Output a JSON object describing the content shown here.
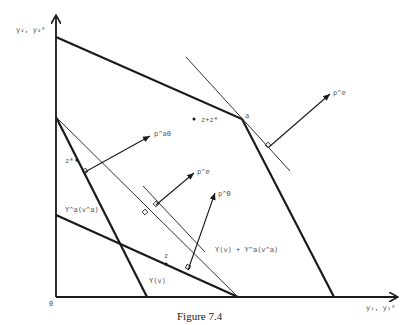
{
  "figure": {
    "caption": "Figure 7.4",
    "colors": {
      "ink": "#1a1a1a",
      "thin": "#333333",
      "label": "#555555"
    }
  },
  "axes": {
    "y_label": "y₂, y₂⁰",
    "x_label": "y₁, y₁⁰",
    "origin_label": "0"
  },
  "labels": {
    "vertex_a": "a",
    "z_plus_zstar": "z+z*",
    "z_star": "z*",
    "z": "z",
    "p_a0": "p^a0",
    "p_e_upper": "p^e",
    "p_e_middle": "p^e",
    "p_0": "p^0",
    "Ya_va": "Y^a(v^a)",
    "Y_v": "Y(v)",
    "sum_set": "Y(v)  +  Y^a(v^a)"
  }
}
